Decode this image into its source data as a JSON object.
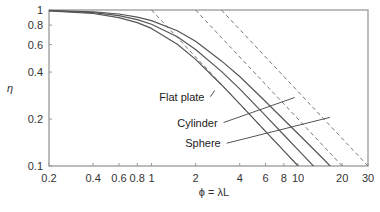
{
  "chart_data": {
    "type": "line",
    "title": "",
    "xlabel": "ϕ = λL",
    "ylabel": "η",
    "xscale": "log",
    "yscale": "log",
    "xlim": [
      0.2,
      30
    ],
    "ylim": [
      0.1,
      1
    ],
    "grid": false,
    "legend": "inline annotations",
    "x_ticks": [
      "0.2",
      "0.4",
      "0.6",
      "0.8",
      "1",
      "2",
      "4",
      "6",
      "8",
      "10",
      "20",
      "30"
    ],
    "x_tick_values": [
      0.2,
      0.4,
      0.6,
      0.8,
      1,
      2,
      4,
      6,
      8,
      10,
      20,
      30
    ],
    "y_ticks": [
      "0.1",
      "0.2",
      "0.4",
      "0.6",
      "0.8",
      "1"
    ],
    "y_tick_values": [
      0.1,
      0.2,
      0.4,
      0.6,
      0.8,
      1
    ],
    "series": [
      {
        "name": "Flat plate",
        "style": "solid",
        "x": [
          0.2,
          0.4,
          0.6,
          0.8,
          1,
          1.5,
          2,
          3,
          4,
          6,
          8,
          10
        ],
        "y": [
          0.987,
          0.95,
          0.894,
          0.83,
          0.762,
          0.603,
          0.482,
          0.332,
          0.25,
          0.167,
          0.125,
          0.1
        ]
      },
      {
        "name": "Cylinder",
        "style": "solid",
        "x": [
          0.2,
          0.4,
          0.6,
          0.8,
          1,
          1.5,
          2,
          3,
          4,
          6,
          8,
          10,
          15,
          20
        ],
        "y": [
          0.99,
          0.962,
          0.92,
          0.868,
          0.811,
          0.673,
          0.558,
          0.404,
          0.312,
          0.21,
          0.158,
          0.127,
          0.085,
          0.064
        ]
      },
      {
        "name": "Sphere",
        "style": "solid",
        "x": [
          0.2,
          0.4,
          0.6,
          0.8,
          1,
          1.5,
          2,
          3,
          4,
          6,
          8,
          10,
          15,
          20,
          30
        ],
        "y": [
          0.993,
          0.974,
          0.942,
          0.901,
          0.855,
          0.737,
          0.63,
          0.472,
          0.375,
          0.259,
          0.198,
          0.161,
          0.11,
          0.083,
          0.057
        ]
      },
      {
        "name": "Flat plate asymptote (1/ϕ)",
        "style": "dashed",
        "x": [
          1,
          10
        ],
        "y": [
          1,
          0.1
        ]
      },
      {
        "name": "Cylinder asymptote (2/ϕ)",
        "style": "dashed",
        "x": [
          2,
          20
        ],
        "y": [
          1,
          0.1
        ]
      },
      {
        "name": "Sphere asymptote (3/ϕ)",
        "style": "dashed",
        "x": [
          3,
          30
        ],
        "y": [
          1,
          0.1
        ]
      }
    ],
    "annotations": [
      {
        "text": "Flat plate",
        "label_x": 1.13,
        "label_y": 0.278,
        "pointer_to": [
          2.7,
          0.305
        ]
      },
      {
        "text": "Cylinder",
        "label_x": 1.5,
        "label_y": 0.19,
        "pointer_to": [
          9.5,
          0.275
        ]
      },
      {
        "text": "Sphere",
        "label_x": 1.7,
        "label_y": 0.14,
        "pointer_to": [
          16.5,
          0.205
        ]
      }
    ]
  },
  "colors": {
    "curve": "#555555",
    "dashed": "#777777",
    "axis": "#999999",
    "text": "#333333"
  },
  "plot_area": {
    "left": 49,
    "right": 368,
    "top": 10,
    "bottom": 166
  }
}
